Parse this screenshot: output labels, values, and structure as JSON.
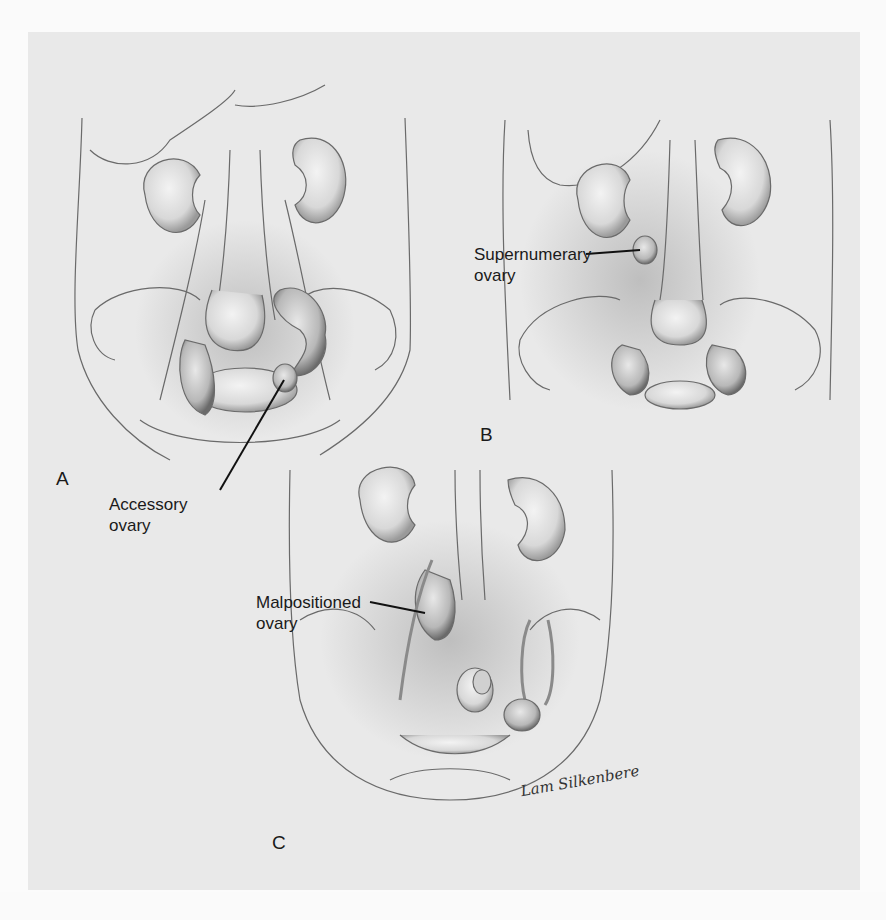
{
  "figure": {
    "panels": [
      {
        "id": "A",
        "letter": "A",
        "label_line1": "Accessory",
        "label_line2": "ovary"
      },
      {
        "id": "B",
        "letter": "B",
        "label_line1": "Supernumerary",
        "label_line2": "ovary"
      },
      {
        "id": "C",
        "letter": "C",
        "label_line1": "Malpositioned",
        "label_line2": "ovary"
      }
    ],
    "signature": "Lam Silkenbere",
    "colors": {
      "panel_background": "#e9e9e9",
      "page_background": "#fbfbfb",
      "ink": "#1a1a1a",
      "pencil": "#6a6a6a"
    }
  }
}
